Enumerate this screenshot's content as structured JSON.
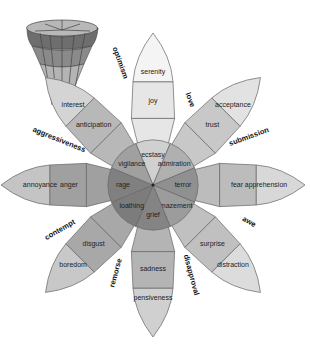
{
  "diagram": {
    "center": [
      153,
      185
    ],
    "petals": [
      {
        "angle": -90,
        "outer": "serenity",
        "middle": "joy",
        "inner": "ecstasy",
        "shades": [
          "#f4f4f4",
          "#e6e6e6",
          "#d0d0d0"
        ]
      },
      {
        "angle": -45,
        "outer": "acceptance",
        "middle": "trust",
        "inner": "admiration",
        "shades": [
          "#e2e2e2",
          "#c8c8c8",
          "#b0b0b0"
        ]
      },
      {
        "angle": 0,
        "outer": "apprehension",
        "middle": "fear",
        "inner": "terror",
        "shades": [
          "#d8d8d8",
          "#bcbcbc",
          "#909090"
        ]
      },
      {
        "angle": 45,
        "outer": "distraction",
        "middle": "surprise",
        "inner": "amazement",
        "shades": [
          "#dcdcdc",
          "#c0c0c0",
          "#9c9c9c"
        ]
      },
      {
        "angle": 90,
        "outer": "pensiveness",
        "middle": "sadness",
        "inner": "grief",
        "shades": [
          "#d0d0d0",
          "#b4b4b4",
          "#848484"
        ]
      },
      {
        "angle": 135,
        "outer": "boredom",
        "middle": "disgust",
        "inner": "loathing",
        "shades": [
          "#c8c8c8",
          "#a8a8a8",
          "#7c7c7c"
        ]
      },
      {
        "angle": 180,
        "outer": "annoyance",
        "middle": "anger",
        "inner": "rage",
        "shades": [
          "#c4c4c4",
          "#a0a0a0",
          "#808080"
        ]
      },
      {
        "angle": -135,
        "outer": "interest",
        "middle": "anticipation",
        "inner": "vigilance",
        "shades": [
          "#d4d4d4",
          "#b8b8b8",
          "#a0a0a0"
        ]
      }
    ],
    "dyads": [
      {
        "label": "love",
        "x": 190,
        "y": 100,
        "rotate": 70
      },
      {
        "label": "submission",
        "x": 249,
        "y": 137,
        "rotate": -20
      },
      {
        "label": "awe",
        "x": 249,
        "y": 222,
        "rotate": 30
      },
      {
        "label": "disapproval",
        "x": 191,
        "y": 275,
        "rotate": 75
      },
      {
        "label": "remorse",
        "x": 116,
        "y": 273,
        "rotate": -75
      },
      {
        "label": "contempt",
        "x": 60,
        "y": 230,
        "rotate": -30
      },
      {
        "label": "aggressiveness",
        "x": 59,
        "y": 140,
        "rotate": 22
      },
      {
        "label": "optimism",
        "x": 120,
        "y": 63,
        "rotate": 70
      }
    ],
    "cone_icon": "3d-emotion-cone-icon"
  }
}
